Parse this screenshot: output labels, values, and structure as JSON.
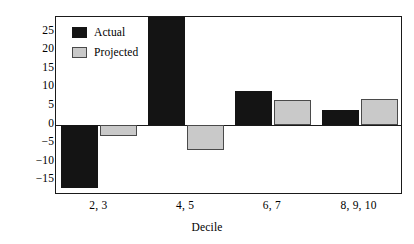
{
  "chart_data": {
    "type": "bar",
    "title": "",
    "xlabel": "Decile",
    "ylabel": "",
    "categories": [
      "2, 3",
      "4, 5",
      "6, 7",
      "8, 9, 10"
    ],
    "series": [
      {
        "name": "Actual",
        "color": "#141414",
        "values": [
          -17,
          30,
          9,
          4
        ]
      },
      {
        "name": "Projected",
        "color": "#c9c9c9",
        "values": [
          -3,
          -7,
          6.5,
          7
        ]
      }
    ],
    "yticks": [
      25,
      20,
      15,
      10,
      5,
      0,
      "−5",
      "−10",
      "−15"
    ],
    "ytick_values": [
      25,
      20,
      15,
      10,
      5,
      0,
      -5,
      -10,
      -15
    ],
    "ylim": [
      -19,
      29
    ],
    "grid": false,
    "legend_position": "top-left",
    "note_top_bar_clipped": "Actual bar for 4, 5 extends beyond the top of the axis"
  },
  "legend": {
    "items": [
      {
        "label": "Actual"
      },
      {
        "label": "Projected"
      }
    ]
  },
  "colors": {
    "actual": "#141414",
    "projected": "#c9c9c9",
    "projected_border": "#4a4a4a",
    "axis": "#1a1a1a",
    "background": "#ffffff"
  }
}
